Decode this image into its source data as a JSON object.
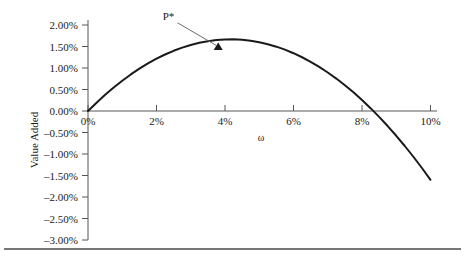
{
  "figure": {
    "background_color": "#ffffff",
    "footer_rule_color": "#4a4a4a"
  },
  "chart_data": {
    "type": "line",
    "title": "",
    "subtitle": "",
    "xlabel": "ω",
    "ylabel": "Value Added",
    "xlim": [
      0,
      10
    ],
    "ylim": [
      -3.0,
      2.0
    ],
    "grid": false,
    "legend": "none",
    "x_unit": "%",
    "y_unit": "%",
    "x_tick_labels": [
      "0%",
      "2%",
      "4%",
      "6%",
      "8%",
      "10%"
    ],
    "x_tick_values": [
      0,
      2,
      4,
      6,
      8,
      10
    ],
    "y_tick_labels": [
      "2.00%",
      "1.50%",
      "1.00%",
      "0.50%",
      "0.00%",
      "–0.50%",
      "–1.00%",
      "–1.50%",
      "–2.00%",
      "–2.50%",
      "–3.00%"
    ],
    "y_tick_values": [
      2.0,
      1.5,
      1.0,
      0.5,
      0.0,
      -0.5,
      -1.0,
      -1.5,
      -2.0,
      -2.5,
      -3.0
    ],
    "series": [
      {
        "name": "Value Added",
        "color": "#1a1a1a",
        "line_width": 2,
        "x": [
          0.0,
          0.25,
          0.5,
          0.75,
          1.0,
          1.25,
          1.5,
          1.75,
          2.0,
          2.25,
          2.5,
          2.75,
          3.0,
          3.25,
          3.5,
          3.75,
          4.0,
          4.25,
          4.5,
          4.75,
          5.0,
          5.25,
          5.5,
          5.75,
          6.0,
          6.25,
          6.5,
          6.75,
          7.0,
          7.25,
          7.5,
          7.75,
          8.0,
          8.25,
          8.5,
          8.75,
          9.0,
          9.25,
          9.5,
          9.75,
          10.0
        ],
        "y": [
          0.0,
          0.194,
          0.376,
          0.546,
          0.704,
          0.85,
          0.984,
          1.106,
          1.216,
          1.314,
          1.4,
          1.474,
          1.536,
          1.586,
          1.624,
          1.65,
          1.664,
          1.666,
          1.656,
          1.634,
          1.6,
          1.554,
          1.496,
          1.426,
          1.344,
          1.25,
          1.144,
          1.026,
          0.896,
          0.754,
          0.6,
          0.434,
          0.256,
          0.066,
          -0.136,
          -0.35,
          -0.576,
          -0.814,
          -1.064,
          -1.326,
          -1.6
        ]
      }
    ],
    "annotations": [
      {
        "label": "P*",
        "type": "arrow-callout",
        "point_x": 3.8,
        "point_y": 1.48,
        "marker": "triangle",
        "marker_color": "#1a1a1a",
        "label_x": 2.35,
        "label_y": 2.12
      }
    ],
    "axis": {
      "color": "#565656",
      "line_width": 1,
      "x_axis_at_y": 0.0,
      "y_axis_at_x": 0.0
    }
  }
}
